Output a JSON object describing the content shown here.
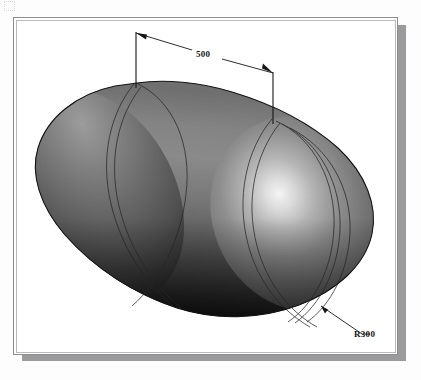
{
  "figure": {
    "kind": "cad-shaded-3d-solid",
    "frame": {
      "border_color": "#8e8e90",
      "inner_border_color": "#b9b9bb",
      "background_color": "#ffffff",
      "shadow_color": "#9a9a9c"
    },
    "solid": {
      "name": "capsule-body",
      "highlight_color": "#f2f2f2",
      "midtone_color": "#6e6e6e",
      "shadow_color": "#1a1a1a",
      "outline_color": "#141414",
      "seam_line_color": "#2a2a2a"
    },
    "dimensions": [
      {
        "id": "length",
        "label": "500",
        "kind": "linear",
        "description": "Length between the two tangent seams of the cylindrical section"
      },
      {
        "id": "end-radius",
        "label": "R300",
        "kind": "radial-leader",
        "description": "Radius of the hemispherical end cap"
      }
    ],
    "scan_artifacts": {
      "bleed_text_top_1": "",
      "bleed_text_top_2": ""
    }
  }
}
